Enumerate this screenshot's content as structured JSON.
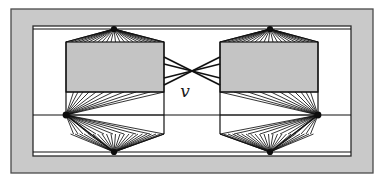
{
  "figure": {
    "kind": "graph-diagram",
    "caption_label": "v",
    "background_color": "#ffffff"
  },
  "colors": {
    "paper": "#ffffff",
    "outer_frame_fill": "#c9c9c9",
    "outer_frame_stroke": "#4a4a4a",
    "inner_frame_stroke": "#2b2b2b",
    "inner_frame_fill": "#ffffff",
    "blob_fill": "#c4c4c4",
    "blob_stroke": "#1a1a1a",
    "edge_stroke": "#111111",
    "vertex_fill": "#0d0d0d",
    "label_color": "#1a1a1a"
  },
  "frames": [
    {
      "name": "outer-frame",
      "x": 11,
      "y": 9,
      "width": 362,
      "height": 164,
      "stroke_width": 1.2
    },
    {
      "name": "inner-frame",
      "x": 33,
      "y": 26,
      "width": 318,
      "height": 130,
      "stroke_width": 1.2
    }
  ],
  "gadgets": [
    {
      "name": "left-gadget",
      "side": "left",
      "blob": {
        "x": 66,
        "y": 42,
        "width": 98,
        "height": 50
      },
      "apex_top": {
        "x": 114,
        "y": 29,
        "label": "top-vertex"
      },
      "apex_bottom": {
        "x": 114,
        "y": 152,
        "label": "bottom-vertex"
      },
      "apex_side": {
        "x": 66,
        "y": 115,
        "label": "side-vertex"
      },
      "fan_count": 22,
      "hex_outline": [
        [
          66,
          42
        ],
        [
          164,
          42
        ],
        [
          164,
          92
        ],
        [
          164,
          134
        ],
        [
          114,
          152
        ],
        [
          66,
          115
        ]
      ]
    },
    {
      "name": "right-gadget",
      "side": "right",
      "blob": {
        "x": 220,
        "y": 42,
        "width": 98,
        "height": 50
      },
      "apex_top": {
        "x": 270,
        "y": 29,
        "label": "top-vertex"
      },
      "apex_bottom": {
        "x": 270,
        "y": 152,
        "label": "bottom-vertex"
      },
      "apex_side": {
        "x": 318,
        "y": 115,
        "label": "side-vertex"
      },
      "fan_count": 22,
      "hex_outline": [
        [
          318,
          42
        ],
        [
          220,
          42
        ],
        [
          220,
          92
        ],
        [
          220,
          134
        ],
        [
          270,
          152
        ],
        [
          318,
          115
        ]
      ]
    }
  ],
  "crossing_edges": {
    "name": "central-crossing",
    "center": {
      "x": 192,
      "y": 71
    },
    "label": "v",
    "label_position": {
      "x": 185,
      "y": 95
    },
    "edge_count": 4,
    "endpoints_left": [
      [
        164,
        57
      ],
      [
        164,
        64
      ],
      [
        164,
        78
      ],
      [
        164,
        85
      ]
    ],
    "endpoints_right": [
      [
        220,
        57
      ],
      [
        220,
        64
      ],
      [
        220,
        78
      ],
      [
        220,
        85
      ]
    ]
  },
  "connector_lines": [
    {
      "name": "upper-rail",
      "from": [
        33,
        29
      ],
      "to": [
        351,
        29
      ]
    },
    {
      "name": "mid-rail",
      "from": [
        33,
        115
      ],
      "to": [
        351,
        115
      ]
    },
    {
      "name": "lower-rail",
      "from": [
        33,
        152
      ],
      "to": [
        351,
        152
      ]
    },
    {
      "name": "blob-mid-left",
      "from": [
        66,
        92
      ],
      "to": [
        164,
        92
      ]
    },
    {
      "name": "blob-mid-right",
      "from": [
        220,
        92
      ],
      "to": [
        318,
        92
      ]
    }
  ]
}
